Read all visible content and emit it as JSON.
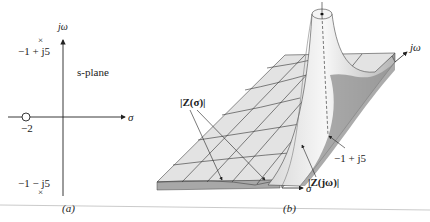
{
  "panel_a": {
    "caption": "(a)",
    "plane_label": "s-plane",
    "axis_x": "σ",
    "axis_y": "jω",
    "pole_upper": "−1 + j5",
    "pole_lower": "−1 − j5",
    "zero": "−2",
    "pole_marker": "×",
    "zero_marker": "○"
  },
  "panel_b": {
    "caption": "(b)",
    "axis_x": "σ",
    "axis_y": "jω",
    "label_z_sigma": "|Z(σ)|",
    "label_z_jw": "|Z(jω)|",
    "label_pole": "−1 + j5"
  },
  "colors": {
    "surface": "#e6e6e6",
    "surface_shadow": "#9a9a9a",
    "grid": "#333333",
    "rule": "#bdbdbd"
  }
}
